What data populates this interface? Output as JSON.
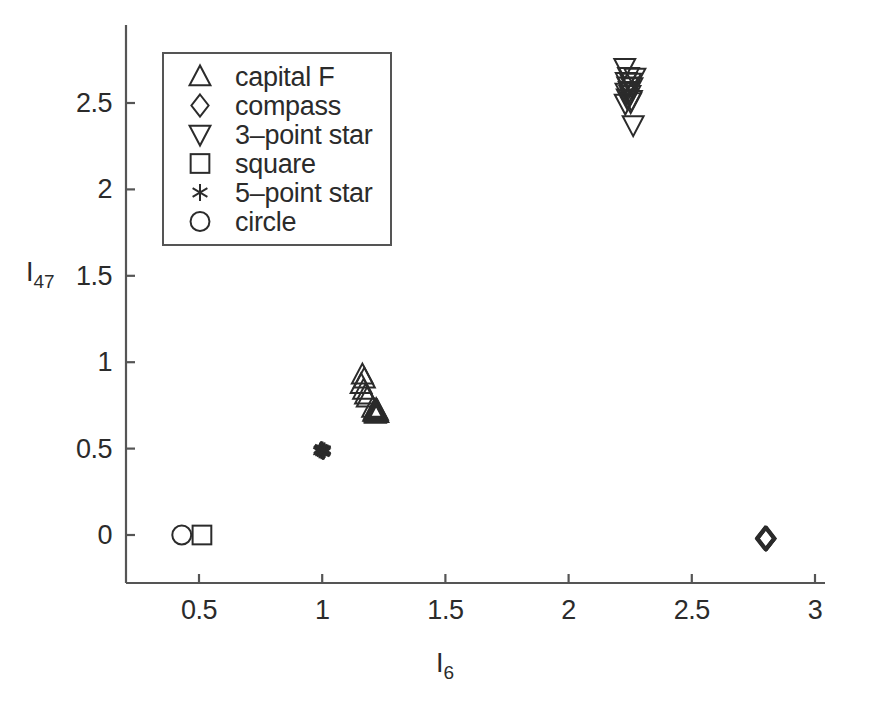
{
  "chart_data": {
    "type": "scatter",
    "title": "",
    "xlabel": "I6",
    "xlabel_base": "I",
    "xlabel_sub": "6",
    "ylabel": "I47",
    "ylabel_base": "I",
    "ylabel_sub": "47",
    "xlim": [
      0.29,
      3.07
    ],
    "ylim": [
      -0.31,
      2.88
    ],
    "xticks": [
      0.5,
      1,
      1.5,
      2,
      2.5,
      3
    ],
    "xtick_labels": [
      "0.5",
      "1",
      "1.5",
      "2",
      "2.5",
      "3"
    ],
    "yticks": [
      0,
      0.5,
      1,
      1.5,
      2,
      2.5
    ],
    "ytick_labels": [
      "0",
      "0.5",
      "1",
      "1.5",
      "2",
      "2.5"
    ],
    "grid": false,
    "legend_position": "upper-left-inside",
    "axis_color": "#555555",
    "marker_color": "#2b2b2b",
    "series": [
      {
        "name": "capital F",
        "marker": "triangle-up",
        "points": [
          [
            1.163,
            0.928
          ],
          [
            1.171,
            0.905
          ],
          [
            1.158,
            0.872
          ],
          [
            1.168,
            0.84
          ],
          [
            1.176,
            0.812
          ],
          [
            1.183,
            0.795
          ],
          [
            1.205,
            0.735
          ],
          [
            1.213,
            0.722
          ],
          [
            1.221,
            0.715
          ],
          [
            1.226,
            0.705
          ],
          [
            1.216,
            0.7
          ],
          [
            1.209,
            0.712
          ],
          [
            1.219,
            0.728
          ],
          [
            1.224,
            0.718
          ],
          [
            1.214,
            0.708
          ]
        ]
      },
      {
        "name": "compass",
        "marker": "diamond",
        "points": [
          [
            2.8,
            -0.018
          ],
          [
            2.804,
            -0.022
          ],
          [
            2.797,
            -0.015
          ],
          [
            2.801,
            -0.026
          ],
          [
            2.806,
            -0.02
          ],
          [
            2.799,
            -0.024
          ],
          [
            2.802,
            -0.017
          ],
          [
            2.795,
            -0.021
          ],
          [
            2.803,
            -0.023
          ],
          [
            2.798,
            -0.019
          ]
        ]
      },
      {
        "name": "3-point star",
        "marker": "triangle-down",
        "points": [
          [
            2.228,
            2.704
          ],
          [
            2.243,
            2.651
          ],
          [
            2.269,
            2.648
          ],
          [
            2.234,
            2.622
          ],
          [
            2.251,
            2.618
          ],
          [
            2.24,
            2.597
          ],
          [
            2.257,
            2.592
          ],
          [
            2.246,
            2.57
          ],
          [
            2.233,
            2.56
          ],
          [
            2.249,
            2.548
          ],
          [
            2.238,
            2.527
          ],
          [
            2.255,
            2.518
          ],
          [
            2.23,
            2.497
          ],
          [
            2.252,
            2.505
          ],
          [
            2.262,
            2.372
          ]
        ]
      },
      {
        "name": "square",
        "marker": "square",
        "points": [
          [
            0.512,
            0.0
          ]
        ]
      },
      {
        "name": "5-point star",
        "marker": "asterisk",
        "points": [
          [
            0.995,
            0.497
          ],
          [
            1.002,
            0.492
          ],
          [
            0.998,
            0.486
          ],
          [
            1.006,
            0.489
          ],
          [
            0.991,
            0.494
          ],
          [
            1.004,
            0.483
          ],
          [
            0.997,
            0.48
          ],
          [
            1.009,
            0.495
          ],
          [
            0.993,
            0.488
          ],
          [
            1.001,
            0.5
          ],
          [
            1.007,
            0.479
          ],
          [
            0.989,
            0.485
          ],
          [
            1.003,
            0.476
          ],
          [
            0.996,
            0.502
          ],
          [
            1.01,
            0.487
          ]
        ]
      },
      {
        "name": "circle",
        "marker": "circle",
        "points": [
          [
            0.43,
            0.0
          ]
        ]
      }
    ]
  },
  "legend": {
    "items": [
      {
        "label": "capital F",
        "marker": "triangle-up"
      },
      {
        "label": "compass",
        "marker": "diamond"
      },
      {
        "label": "3–point star",
        "marker": "triangle-down"
      },
      {
        "label": "square",
        "marker": "square"
      },
      {
        "label": "5–point star",
        "marker": "asterisk"
      },
      {
        "label": "circle",
        "marker": "circle"
      }
    ]
  },
  "colors": {
    "background": "#ffffff",
    "axis": "#555555",
    "marker": "#2b2b2b",
    "legend_border": "#555555",
    "text": "#2b2b2b"
  }
}
